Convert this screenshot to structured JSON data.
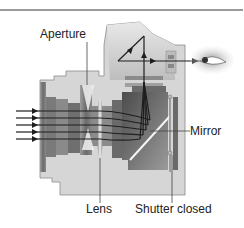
{
  "diagram": {
    "type": "cross-section",
    "labels": {
      "aperture": "Aperture",
      "lens": "Lens",
      "mirror": "Mirror",
      "shutter": "Shutter closed"
    },
    "elements": [
      "light-rays",
      "lens-barrel",
      "aperture",
      "lens",
      "mirror",
      "pentaprism",
      "viewfinder",
      "eye",
      "shutter"
    ],
    "colors": {
      "body": "#d4d4d4",
      "body_outline": "#8c8c8c",
      "dark": "#5a5a5a",
      "ray": "#1e1e1e",
      "text": "#222222",
      "rule": "#9a9a9a"
    }
  }
}
